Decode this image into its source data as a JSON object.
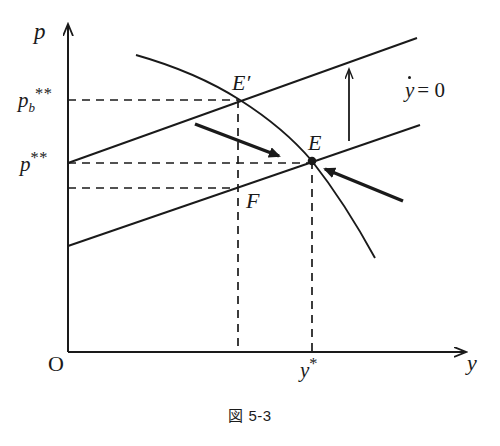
{
  "figure": {
    "caption": "図 5-3",
    "axes": {
      "y_axis_label": "p",
      "x_axis_label": "y",
      "origin_label": "O"
    },
    "tick_labels": {
      "p_b_star_star_base": "p",
      "p_b_star_star_sub": "b",
      "p_b_star_star_sup": "**",
      "p_star_star_base": "p",
      "p_star_star_sup": "**",
      "y_star_base": "y",
      "y_star_sup": "*"
    },
    "point_labels": {
      "e_prime": "E′",
      "e": "E",
      "f": "F"
    },
    "curve_labels": {
      "ydot_zero_var": "y",
      "ydot_zero_rest": "= 0"
    },
    "colors": {
      "ink": "#1a1a1a",
      "background": "#ffffff"
    },
    "geometry": {
      "axis_origin": [
        68,
        352
      ],
      "y_axis_top": [
        68,
        22
      ],
      "x_axis_right": [
        468,
        352
      ],
      "upper_line": [
        [
          68,
          163
        ],
        [
          417,
          38
        ]
      ],
      "lower_line": [
        [
          68,
          246
        ],
        [
          420,
          125
        ]
      ],
      "curve": [
        [
          136,
          55
        ],
        [
          240,
          100
        ],
        [
          312,
          161
        ],
        [
          375,
          258
        ]
      ],
      "point_e": [
        312,
        161
      ],
      "point_e_prime": [
        238,
        99
      ],
      "point_f": [
        238,
        188
      ],
      "dashed_h_levels": [
        100,
        163,
        188
      ],
      "dashed_v_positions": [
        238,
        312
      ],
      "arrow_up": [
        [
          349,
          141
        ],
        [
          349,
          68
        ]
      ],
      "arrow_right_down": [
        [
          195,
          124
        ],
        [
          281,
          157
        ]
      ],
      "arrow_in_left": [
        [
          403,
          201
        ],
        [
          322,
          168
        ]
      ]
    }
  }
}
